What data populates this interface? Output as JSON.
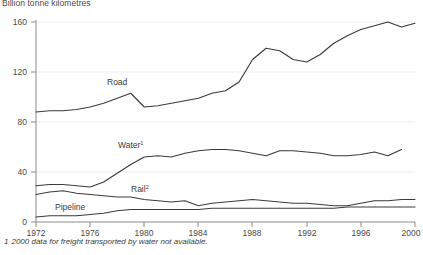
{
  "axis_title": "Billion tonne kilometres",
  "footnote": {
    "number": "1",
    "text": "2000 data for freight transported by water not available."
  },
  "labels": {
    "road": "Road",
    "water": "Water",
    "water_sup": "1",
    "rail": "Rail",
    "rail_sup": "2",
    "pipeline": "Pipeline"
  },
  "chart_data": {
    "type": "line",
    "title": "",
    "subtitle": "",
    "xlabel": "",
    "ylabel": "Billion tonne kilometres",
    "xlim": [
      1972,
      2000
    ],
    "ylim": [
      0,
      160
    ],
    "yticks": [
      0,
      40,
      80,
      120,
      160
    ],
    "xticks": [
      1972,
      1976,
      1980,
      1984,
      1988,
      1992,
      1996,
      2000
    ],
    "grid": "horizontal",
    "legend": "inline-labels",
    "x": [
      1972,
      1973,
      1974,
      1975,
      1976,
      1977,
      1978,
      1979,
      1980,
      1981,
      1982,
      1983,
      1984,
      1985,
      1986,
      1987,
      1988,
      1989,
      1990,
      1991,
      1992,
      1993,
      1994,
      1995,
      1996,
      1997,
      1998,
      1999,
      2000
    ],
    "series": [
      {
        "name": "Road",
        "values": [
          88,
          89,
          89,
          90,
          92,
          95,
          99,
          103,
          92,
          93,
          95,
          97,
          99,
          103,
          105,
          112,
          130,
          139,
          137,
          130,
          128,
          134,
          143,
          149,
          154,
          157,
          160,
          156,
          159
        ]
      },
      {
        "name": "Water",
        "values": [
          29,
          30,
          30,
          29,
          28,
          32,
          39,
          46,
          52,
          53,
          52,
          55,
          57,
          58,
          58,
          57,
          55,
          53,
          57,
          57,
          56,
          55,
          53,
          53,
          54,
          56,
          53,
          58,
          null
        ]
      },
      {
        "name": "Rail",
        "values": [
          22,
          24,
          25,
          23,
          22,
          21,
          20,
          20,
          18,
          17,
          16,
          17,
          13,
          15,
          16,
          17,
          18,
          17,
          16,
          15,
          15,
          14,
          13,
          13,
          15,
          17,
          17,
          18,
          18
        ]
      },
      {
        "name": "Pipeline",
        "values": [
          4,
          5,
          5,
          5,
          6,
          7,
          9,
          10,
          10,
          10,
          10,
          10,
          10,
          11,
          11,
          11,
          11,
          11,
          11,
          11,
          11,
          11,
          11,
          12,
          12,
          12,
          12,
          12,
          12
        ]
      }
    ],
    "notes": [
      "1 2000 data for freight transported by water not available."
    ]
  }
}
